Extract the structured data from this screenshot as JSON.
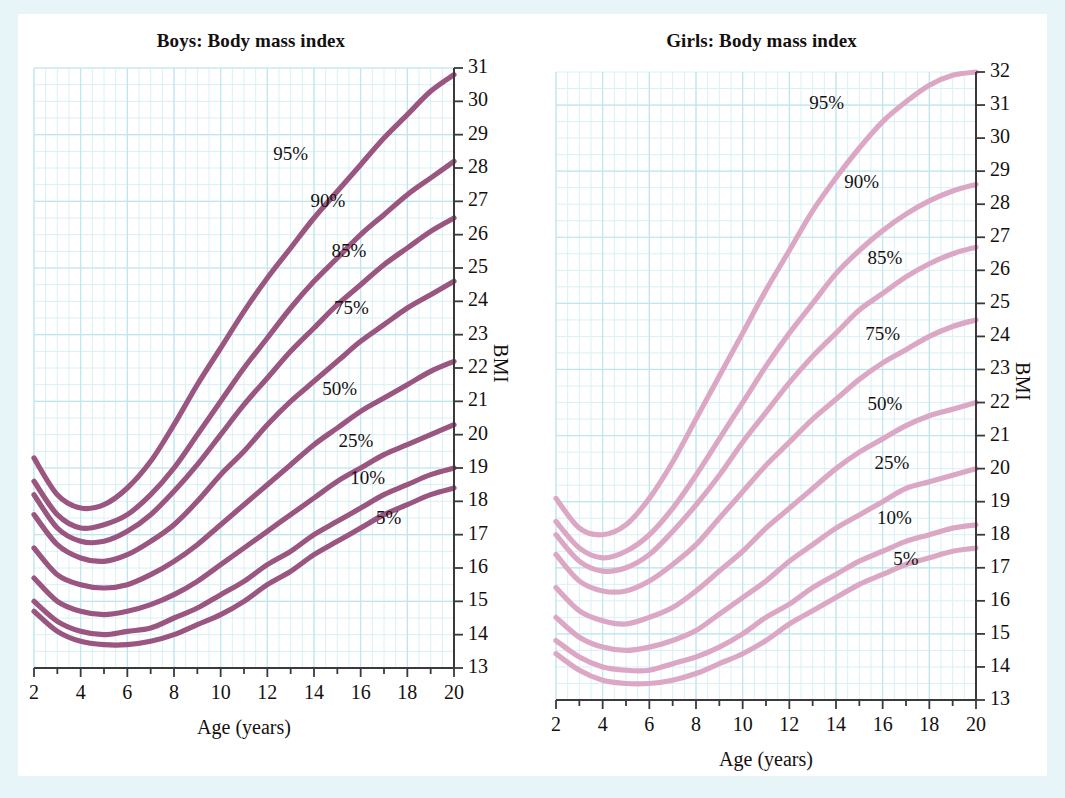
{
  "page": {
    "background_color": "#e7f4f8",
    "panel_color": "#ffffff",
    "grid_minor_color": "#d9f0f4",
    "grid_major_color": "#bfe6ee",
    "axis_color": "#3a3a3a",
    "text_color": "#14100f"
  },
  "charts": [
    {
      "id": "boys",
      "title": "Boys: Body mass index",
      "xlabel": "Age (years)",
      "ylabel": "BMI",
      "line_color": "#9a5580",
      "xticks": [
        2,
        4,
        6,
        8,
        10,
        12,
        14,
        16,
        18,
        20
      ],
      "xtick_labels": [
        "2",
        "4",
        "6",
        "8",
        "10",
        "12",
        "14",
        "16",
        "18",
        "20"
      ],
      "yticks": [
        13,
        14,
        15,
        16,
        17,
        18,
        19,
        20,
        21,
        22,
        23,
        24,
        25,
        26,
        27,
        28,
        29,
        30,
        31
      ],
      "ytick_labels": [
        "13",
        "14",
        "15",
        "16",
        "17",
        "18",
        "19",
        "20",
        "21",
        "22",
        "23",
        "24",
        "25",
        "26",
        "27",
        "28",
        "29",
        "30",
        "31"
      ],
      "percentile_labels": [
        {
          "text": "95%",
          "x": 13.0,
          "y": 28.35
        },
        {
          "text": "90%",
          "x": 14.6,
          "y": 26.95
        },
        {
          "text": "85%",
          "x": 15.5,
          "y": 25.45
        },
        {
          "text": "75%",
          "x": 15.6,
          "y": 23.75
        },
        {
          "text": "50%",
          "x": 15.1,
          "y": 21.3
        },
        {
          "text": "25%",
          "x": 15.8,
          "y": 19.75
        },
        {
          "text": "10%",
          "x": 16.3,
          "y": 18.65
        },
        {
          "text": "5%",
          "x": 17.2,
          "y": 17.45
        }
      ]
    },
    {
      "id": "girls",
      "title": "Girls: Body mass index",
      "xlabel": "Age (years)",
      "ylabel": "BMI",
      "line_color": "#dba7c5",
      "xticks": [
        2,
        4,
        6,
        8,
        10,
        12,
        14,
        16,
        18,
        20
      ],
      "xtick_labels": [
        "2",
        "4",
        "6",
        "8",
        "10",
        "12",
        "14",
        "16",
        "18",
        "20"
      ],
      "yticks": [
        13,
        14,
        15,
        16,
        17,
        18,
        19,
        20,
        21,
        22,
        23,
        24,
        25,
        26,
        27,
        28,
        29,
        30,
        31,
        32
      ],
      "ytick_labels": [
        "13",
        "14",
        "15",
        "16",
        "17",
        "18",
        "19",
        "20",
        "21",
        "22",
        "23",
        "24",
        "25",
        "26",
        "27",
        "28",
        "29",
        "30",
        "31",
        "32"
      ],
      "percentile_labels": [
        {
          "text": "95%",
          "x": 13.6,
          "y": 31.0
        },
        {
          "text": "90%",
          "x": 15.1,
          "y": 28.6
        },
        {
          "text": "85%",
          "x": 16.1,
          "y": 26.3
        },
        {
          "text": "75%",
          "x": 16.0,
          "y": 24.0
        },
        {
          "text": "50%",
          "x": 16.1,
          "y": 21.9
        },
        {
          "text": "25%",
          "x": 16.4,
          "y": 20.1
        },
        {
          "text": "10%",
          "x": 16.5,
          "y": 18.45
        },
        {
          "text": "5%",
          "x": 17.0,
          "y": 17.2
        }
      ]
    }
  ],
  "chart_data": [
    {
      "type": "line",
      "id": "boys",
      "title": "Boys: Body mass index",
      "xlabel": "Age (years)",
      "ylabel": "BMI",
      "xlim": [
        2,
        20
      ],
      "ylim": [
        13,
        31
      ],
      "grid": true,
      "legend": "inline-curve-labels",
      "x": [
        2,
        3,
        4,
        5,
        6,
        7,
        8,
        9,
        10,
        11,
        12,
        13,
        14,
        15,
        16,
        17,
        18,
        19,
        20
      ],
      "series": [
        {
          "name": "95%",
          "values": [
            19.3,
            18.2,
            17.8,
            17.9,
            18.4,
            19.2,
            20.3,
            21.5,
            22.6,
            23.7,
            24.7,
            25.6,
            26.5,
            27.3,
            28.1,
            28.9,
            29.6,
            30.3,
            30.8
          ]
        },
        {
          "name": "90%",
          "values": [
            18.6,
            17.6,
            17.2,
            17.3,
            17.6,
            18.2,
            19.0,
            20.0,
            21.0,
            22.0,
            22.9,
            23.8,
            24.6,
            25.3,
            26.0,
            26.6,
            27.2,
            27.7,
            28.2
          ]
        },
        {
          "name": "85%",
          "values": [
            18.2,
            17.2,
            16.8,
            16.8,
            17.1,
            17.6,
            18.3,
            19.1,
            20.0,
            20.9,
            21.7,
            22.5,
            23.2,
            23.9,
            24.5,
            25.1,
            25.6,
            26.1,
            26.5
          ]
        },
        {
          "name": "75%",
          "values": [
            17.6,
            16.7,
            16.3,
            16.2,
            16.4,
            16.8,
            17.3,
            18.0,
            18.8,
            19.5,
            20.3,
            21.0,
            21.6,
            22.2,
            22.8,
            23.3,
            23.8,
            24.2,
            24.6
          ]
        },
        {
          "name": "50%",
          "values": [
            16.6,
            15.8,
            15.5,
            15.4,
            15.5,
            15.8,
            16.2,
            16.7,
            17.3,
            17.9,
            18.5,
            19.1,
            19.7,
            20.2,
            20.7,
            21.1,
            21.5,
            21.9,
            22.2
          ]
        },
        {
          "name": "25%",
          "values": [
            15.7,
            15.0,
            14.7,
            14.6,
            14.7,
            14.9,
            15.2,
            15.6,
            16.1,
            16.6,
            17.1,
            17.6,
            18.1,
            18.6,
            19.0,
            19.4,
            19.7,
            20.0,
            20.3
          ]
        },
        {
          "name": "10%",
          "values": [
            15.0,
            14.4,
            14.1,
            14.0,
            14.1,
            14.2,
            14.5,
            14.8,
            15.2,
            15.6,
            16.1,
            16.5,
            17.0,
            17.4,
            17.8,
            18.2,
            18.5,
            18.8,
            19.0
          ]
        },
        {
          "name": "5%",
          "values": [
            14.7,
            14.1,
            13.8,
            13.7,
            13.7,
            13.8,
            14.0,
            14.3,
            14.6,
            15.0,
            15.5,
            15.9,
            16.4,
            16.8,
            17.2,
            17.6,
            17.9,
            18.2,
            18.4
          ]
        }
      ]
    },
    {
      "type": "line",
      "id": "girls",
      "title": "Girls: Body mass index",
      "xlabel": "Age (years)",
      "ylabel": "BMI",
      "xlim": [
        2,
        20
      ],
      "ylim": [
        13,
        32
      ],
      "grid": true,
      "legend": "inline-curve-labels",
      "x": [
        2,
        3,
        4,
        5,
        6,
        7,
        8,
        9,
        10,
        11,
        12,
        13,
        14,
        15,
        16,
        17,
        18,
        19,
        20
      ],
      "series": [
        {
          "name": "95%",
          "values": [
            19.1,
            18.2,
            18.0,
            18.3,
            19.1,
            20.2,
            21.5,
            22.8,
            24.1,
            25.4,
            26.6,
            27.8,
            28.8,
            29.7,
            30.5,
            31.1,
            31.6,
            31.9,
            32.0
          ]
        },
        {
          "name": "90%",
          "values": [
            18.4,
            17.6,
            17.3,
            17.5,
            18.0,
            18.8,
            19.8,
            20.9,
            22.0,
            23.1,
            24.1,
            25.0,
            25.9,
            26.6,
            27.2,
            27.7,
            28.1,
            28.4,
            28.6
          ]
        },
        {
          "name": "85%",
          "values": [
            18.0,
            17.2,
            16.9,
            17.0,
            17.4,
            18.1,
            18.9,
            19.8,
            20.8,
            21.7,
            22.6,
            23.4,
            24.1,
            24.8,
            25.3,
            25.8,
            26.2,
            26.5,
            26.7
          ]
        },
        {
          "name": "75%",
          "values": [
            17.4,
            16.6,
            16.3,
            16.3,
            16.6,
            17.1,
            17.7,
            18.5,
            19.3,
            20.1,
            20.8,
            21.5,
            22.1,
            22.7,
            23.2,
            23.6,
            24.0,
            24.3,
            24.5
          ]
        },
        {
          "name": "50%",
          "values": [
            16.4,
            15.7,
            15.4,
            15.3,
            15.5,
            15.8,
            16.3,
            16.9,
            17.5,
            18.2,
            18.8,
            19.4,
            20.0,
            20.5,
            20.9,
            21.3,
            21.6,
            21.8,
            22.0
          ]
        },
        {
          "name": "25%",
          "values": [
            15.5,
            14.9,
            14.6,
            14.5,
            14.6,
            14.8,
            15.1,
            15.6,
            16.1,
            16.6,
            17.2,
            17.7,
            18.2,
            18.6,
            19.0,
            19.4,
            19.6,
            19.8,
            20.0
          ]
        },
        {
          "name": "10%",
          "values": [
            14.8,
            14.3,
            14.0,
            13.9,
            13.9,
            14.1,
            14.3,
            14.6,
            15.0,
            15.5,
            15.9,
            16.4,
            16.8,
            17.2,
            17.5,
            17.8,
            18.0,
            18.2,
            18.3
          ]
        },
        {
          "name": "5%",
          "values": [
            14.4,
            13.9,
            13.6,
            13.5,
            13.5,
            13.6,
            13.8,
            14.1,
            14.4,
            14.8,
            15.3,
            15.7,
            16.1,
            16.5,
            16.8,
            17.1,
            17.3,
            17.5,
            17.6
          ]
        }
      ]
    }
  ]
}
